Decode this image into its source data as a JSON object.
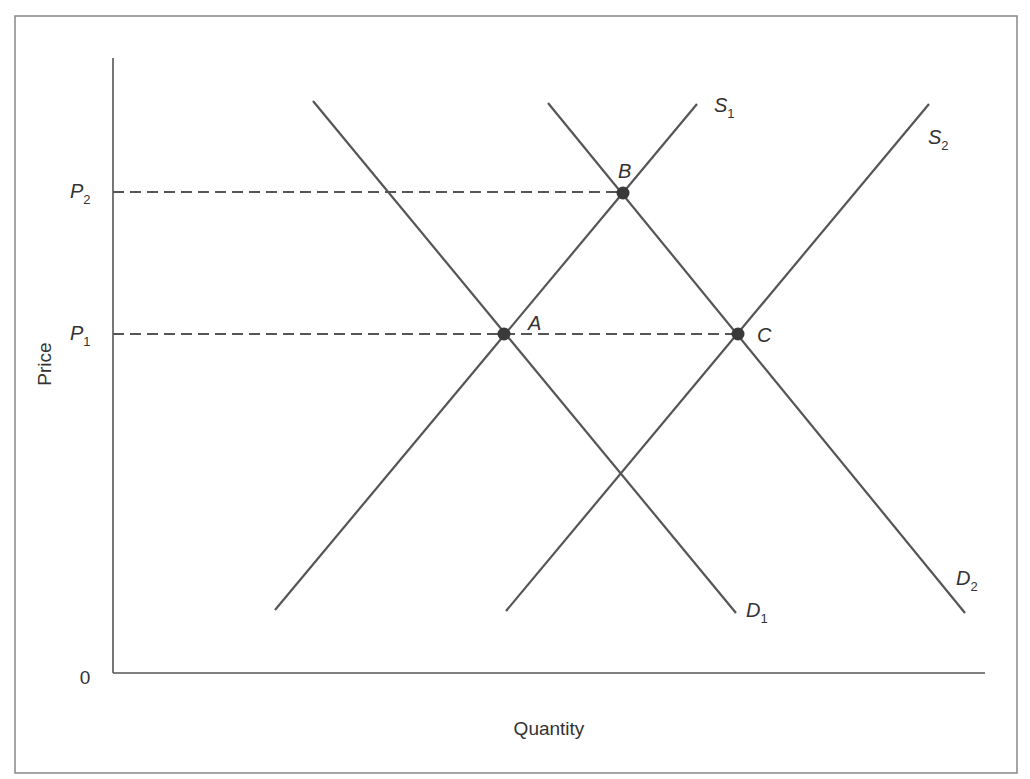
{
  "chart_data": {
    "type": "diagram",
    "title": "",
    "xlabel": "Quantity",
    "ylabel": "Price",
    "origin_label": "0",
    "colors": {
      "frame": "#888888",
      "axis": "#555555",
      "curve": "#555555",
      "dash": "#555555",
      "point": "#3a3a3a",
      "text": "#333333"
    },
    "price_levels": [
      {
        "name": "P",
        "sub": "2",
        "y": 192,
        "dash_to_x": 623
      },
      {
        "name": "P",
        "sub": "1",
        "y": 334,
        "dash_to_x": 738
      }
    ],
    "curves": [
      {
        "id": "S1",
        "name": "S",
        "sub": "1",
        "kind": "supply",
        "x1": 275,
        "y1": 610,
        "x2": 697,
        "y2": 104,
        "label_x": 714,
        "label_y": 112
      },
      {
        "id": "S2",
        "name": "S",
        "sub": "2",
        "kind": "supply",
        "x1": 506,
        "y1": 611,
        "x2": 929,
        "y2": 104,
        "label_x": 928,
        "label_y": 144
      },
      {
        "id": "D1",
        "name": "D",
        "sub": "1",
        "kind": "demand",
        "x1": 313,
        "y1": 101,
        "x2": 736,
        "y2": 613,
        "label_x": 746,
        "label_y": 617
      },
      {
        "id": "D2",
        "name": "D",
        "sub": "2",
        "kind": "demand",
        "x1": 548,
        "y1": 103,
        "x2": 965,
        "y2": 613,
        "label_x": 956,
        "label_y": 585
      }
    ],
    "points": [
      {
        "name": "A",
        "x": 504,
        "y": 334,
        "label_x": 528,
        "label_y": 330
      },
      {
        "name": "B",
        "x": 623,
        "y": 193,
        "label_x": 618,
        "label_y": 178
      },
      {
        "name": "C",
        "x": 738,
        "y": 334,
        "label_x": 757,
        "label_y": 342
      }
    ],
    "axes": {
      "origin_x": 113,
      "origin_y": 673,
      "y_top": 58,
      "x_right": 985
    }
  }
}
